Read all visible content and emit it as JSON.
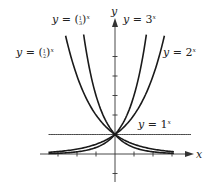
{
  "chart_data": {
    "type": "line",
    "title": "",
    "xlabel": "x",
    "ylabel": "y",
    "xlim": [
      -3.5,
      4
    ],
    "ylim": [
      -1,
      6.2
    ],
    "x_ticks": [
      -3,
      -2,
      -1,
      1,
      2,
      3
    ],
    "y_ticks": [
      -1,
      1,
      2,
      3,
      4,
      5
    ],
    "grid": false,
    "series": [
      {
        "name": "y = (1/3)^x",
        "base": 0.3333,
        "x_range": [
          -1.65,
          3.1
        ],
        "label_prefix": "y = (",
        "frac_num": "1",
        "frac_den": "3",
        "label_suffix": ")",
        "exp": "x"
      },
      {
        "name": "y = (1/2)^x",
        "base": 0.5,
        "x_range": [
          -2.6,
          3.1
        ],
        "label_prefix": "y = (",
        "frac_num": "1",
        "frac_den": "2",
        "label_suffix": ")",
        "exp": "x"
      },
      {
        "name": "y = 3^x",
        "base": 3,
        "x_range": [
          -3.5,
          1.65
        ],
        "label_prefix": "y = 3",
        "exp": "x"
      },
      {
        "name": "y = 2^x",
        "base": 2,
        "x_range": [
          -3.5,
          2.6
        ],
        "label_prefix": "y = 2",
        "exp": "x"
      },
      {
        "name": "y = 1^x",
        "base": 1,
        "x_range": [
          -3.5,
          4.0
        ],
        "label_prefix": "y = 1",
        "exp": "x"
      }
    ],
    "line_color": "#1a1a1a",
    "axis_color": "#333333"
  }
}
